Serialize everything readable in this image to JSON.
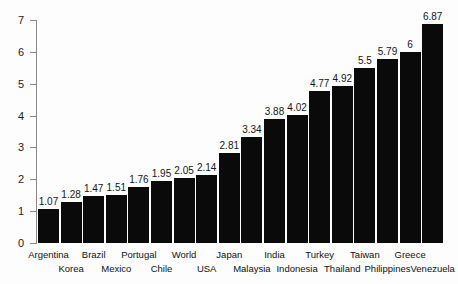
{
  "chart_data": {
    "type": "bar",
    "title": "",
    "subtitle": "",
    "xlabel": "",
    "ylabel": "",
    "ylim": [
      0,
      7
    ],
    "ytick_labels": [
      "7",
      "6",
      "5",
      "4",
      "3",
      "2",
      "1",
      "0"
    ],
    "yticks": [
      7,
      6,
      5,
      4,
      3,
      2,
      1,
      0
    ],
    "grid": false,
    "legend": null,
    "orientation": "vertical",
    "bar_color": "#0a0a0a",
    "axis_color": "#8a8a8a",
    "background_color": "#fdfdfd",
    "label_rows": 2,
    "categories": [
      "Argentina",
      "Korea",
      "Brazil",
      "Mexico",
      "Portugal",
      "Chile",
      "World",
      "USA",
      "Japan",
      "Malaysia",
      "India",
      "Indonesia",
      "Turkey",
      "Thailand",
      "Taiwan",
      "Philippines",
      "Greece",
      "Venezuela"
    ],
    "values": [
      1.07,
      1.28,
      1.47,
      1.51,
      1.76,
      1.95,
      2.05,
      2.14,
      2.81,
      3.34,
      3.88,
      4.02,
      4.77,
      4.92,
      5.5,
      5.79,
      6,
      6.87
    ],
    "value_labels": [
      "1.07",
      "1.28",
      "1.47",
      "1.51",
      "1.76",
      "1.95",
      "2.05",
      "2.14",
      "2.81",
      "3.34",
      "3.88",
      "4.02",
      "4.77",
      "4.92",
      "5.5",
      "5.79",
      "6",
      "6.87"
    ]
  }
}
